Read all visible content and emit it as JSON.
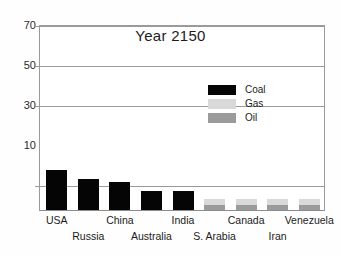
{
  "chart_data": {
    "type": "bar",
    "title": "Year 2150",
    "xlabel": "",
    "ylabel": "",
    "ylim": [
      0,
      78
    ],
    "yticks": [
      10,
      30,
      50,
      70
    ],
    "grid": true,
    "stacked": true,
    "legend_position": "inside-top-right",
    "categories": [
      "USA",
      "Russia",
      "China",
      "Australia",
      "India",
      "S. Arabia",
      "Canada",
      "Iran",
      "Venezuela"
    ],
    "series": [
      {
        "name": "Coal",
        "color": "#050505",
        "values": [
          17,
          13,
          12,
          8,
          8,
          0,
          0,
          0,
          0
        ]
      },
      {
        "name": "Gas",
        "color": "#d9d9d9",
        "values": [
          0,
          0,
          0,
          0,
          0,
          2.5,
          2.5,
          2.5,
          2.5
        ]
      },
      {
        "name": "Oil",
        "color": "#9b9b9b",
        "values": [
          0,
          0,
          0,
          0,
          0,
          2.0,
          2.0,
          2.0,
          2.0
        ]
      }
    ]
  },
  "legend": {
    "items": [
      {
        "label": "Coal",
        "color": "#050505"
      },
      {
        "label": "Gas",
        "color": "#d9d9d9"
      },
      {
        "label": "Oil",
        "color": "#9b9b9b"
      }
    ]
  },
  "axis": {
    "y_tick_labels": [
      "70",
      "50",
      "30",
      "10"
    ]
  },
  "x_labels_row_top": [
    "USA",
    "China",
    "India",
    "Canada",
    "Venezuela"
  ],
  "x_labels_row_bottom": [
    "Russia",
    "Australia",
    "S. Arabia",
    "Iran"
  ]
}
